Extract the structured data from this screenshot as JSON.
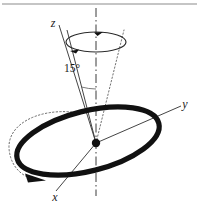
{
  "figure": {
    "type": "physics-diagram",
    "background_color": "#ffffff",
    "ink_color": "#1a1a1a",
    "rule_color": "#8c8c8c",
    "width": 199,
    "height": 213
  },
  "labels": {
    "z_axis": "z",
    "y_axis": "y",
    "x_axis": "x",
    "tilt_angle": "15°"
  },
  "geometry": {
    "origin": {
      "x": 96,
      "y": 143
    },
    "disk": {
      "center_x": 88,
      "center_y": 141,
      "radius_x": 73,
      "radius_y": 30,
      "rotation_deg": -14,
      "stroke_width": 5.2,
      "color": "#111111"
    },
    "precession_axis": {
      "x": 96,
      "y_top": 8,
      "y_bottom": 196,
      "style": "dash-dot",
      "color": "#3a3a3a"
    },
    "cone": {
      "apex_x": 96,
      "apex_y": 143,
      "half_angle_deg": 15,
      "left_edge_style": "solid",
      "right_edge_style": "dotted",
      "top_ellipse": {
        "center_x": 96,
        "center_y": 42,
        "radius_x": 30,
        "radius_y": 10
      }
    },
    "spin_axis": {
      "from_x": 96,
      "from_y": 143,
      "to_x": 59,
      "to_y": 25
    },
    "y_axis_line": {
      "from_x": 96,
      "from_y": 143,
      "to_x": 180,
      "to_y": 106
    },
    "x_axis_line": {
      "from_x": 96,
      "from_y": 143,
      "to_x": 57,
      "to_y": 190
    },
    "spin_arc": {
      "style": "dotted",
      "arrow": "solid-triangle",
      "side": "left"
    }
  },
  "top_rule": {
    "y": 4,
    "color": "#8c8c8c"
  },
  "annotations": {
    "precession_arrows": 2,
    "spin_arrow": 1
  }
}
